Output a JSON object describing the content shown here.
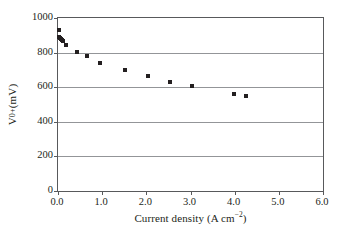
{
  "chart_data": {
    "type": "scatter",
    "title": "",
    "xlabel": "Current density (A cm⁻²)",
    "xlabel_main": "Current density (A cm",
    "xlabel_sup": "−2",
    "xlabel_tail": ")",
    "ylabel": "V0+ (mV)",
    "ylabel_main": "V",
    "ylabel_sub": "0+",
    "ylabel_tail": " (mV)",
    "xlim": [
      0.0,
      6.0
    ],
    "ylim": [
      0,
      1000
    ],
    "xticks": [
      "0.0",
      "1.0",
      "2.0",
      "3.0",
      "4.0",
      "5.0",
      "6.0"
    ],
    "xtick_values": [
      0.0,
      1.0,
      2.0,
      3.0,
      4.0,
      5.0,
      6.0
    ],
    "yticks": [
      "0",
      "200",
      "400",
      "600",
      "800",
      "1000"
    ],
    "ytick_values": [
      0,
      200,
      400,
      600,
      800,
      1000
    ],
    "grid": "horizontal",
    "gridlines_y": [
      200,
      400,
      600,
      800
    ],
    "legend": "none",
    "marker": "square",
    "marker_color": "#231f20",
    "series": [
      {
        "name": "V0+ vs current density",
        "x": [
          0.02,
          0.03,
          0.05,
          0.07,
          0.09,
          0.12,
          0.18,
          0.43,
          0.65,
          0.96,
          1.51,
          2.04,
          2.54,
          3.03,
          3.99,
          4.25
        ],
        "y": [
          928,
          893,
          884,
          878,
          872,
          866,
          843,
          801,
          779,
          740,
          702,
          667,
          632,
          607,
          561,
          549
        ]
      }
    ]
  },
  "axis_colors": {
    "frame": "#58595b",
    "grid": "#939598",
    "marker": "#231f20",
    "background": "#ffffff"
  }
}
